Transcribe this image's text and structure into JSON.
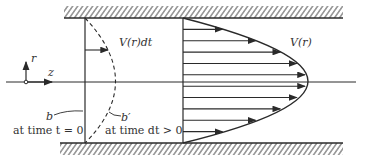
{
  "diagram": {
    "labels": {
      "velocity_profile": "V(r)",
      "displacement": "V(r)dt",
      "axis_r": "r",
      "axis_z": "z",
      "line_b": "b",
      "line_b_prime": "b′",
      "time_zero": "at time t = 0",
      "time_dt": "at time dt > 0"
    },
    "arrow_count": 10,
    "colors": {
      "ink": "#2a2a2a",
      "background": "#ffffff"
    }
  }
}
